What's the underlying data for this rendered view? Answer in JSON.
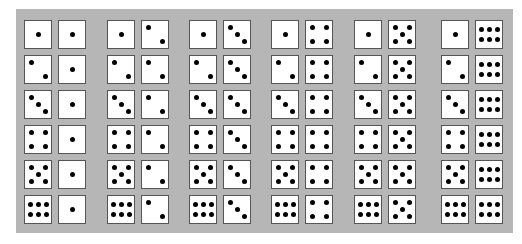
{
  "figure": {
    "colors": {
      "panel": "#b6b6b6",
      "die_face": "#ffffff",
      "die_border": "#555555",
      "pip": "#000000"
    },
    "groups": [
      {
        "second_die": 1,
        "pairs": [
          [
            1,
            1
          ],
          [
            2,
            1
          ],
          [
            3,
            1
          ],
          [
            4,
            1
          ],
          [
            5,
            1
          ],
          [
            6,
            1
          ]
        ]
      },
      {
        "second_die": 2,
        "pairs": [
          [
            1,
            2
          ],
          [
            2,
            2
          ],
          [
            3,
            2
          ],
          [
            4,
            2
          ],
          [
            5,
            2
          ],
          [
            6,
            2
          ]
        ]
      },
      {
        "second_die": 3,
        "pairs": [
          [
            1,
            3
          ],
          [
            2,
            3
          ],
          [
            3,
            3
          ],
          [
            4,
            3
          ],
          [
            5,
            3
          ],
          [
            6,
            3
          ]
        ]
      },
      {
        "second_die": 4,
        "pairs": [
          [
            1,
            4
          ],
          [
            2,
            4
          ],
          [
            3,
            4
          ],
          [
            4,
            4
          ],
          [
            5,
            4
          ],
          [
            6,
            4
          ]
        ]
      },
      {
        "second_die": 5,
        "pairs": [
          [
            1,
            5
          ],
          [
            2,
            5
          ],
          [
            3,
            5
          ],
          [
            4,
            5
          ],
          [
            5,
            5
          ],
          [
            6,
            5
          ]
        ]
      },
      {
        "second_die": 6,
        "pairs": [
          [
            1,
            6
          ],
          [
            2,
            6
          ],
          [
            3,
            6
          ],
          [
            4,
            6
          ],
          [
            5,
            6
          ],
          [
            6,
            6
          ]
        ]
      }
    ]
  }
}
